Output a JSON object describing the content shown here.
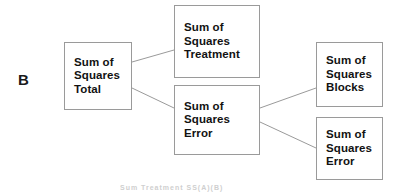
{
  "figure": {
    "panel_label": "B",
    "bottom_caption_fragment": "Sum  Treatment   SS(A)(B)",
    "line_color": "#9a9a9a",
    "box_border_color": "#9a9a9a",
    "text_color": "#121212",
    "background": "#ffffff"
  },
  "diagram_data": {
    "type": "tree-diagram",
    "title": "Sum of Squares decomposition (Panel B)",
    "nodes": [
      {
        "id": "total",
        "lines": [
          "Sum of",
          "Squares",
          "Total"
        ],
        "x": 64,
        "y": 42,
        "w": 68,
        "h": 68
      },
      {
        "id": "treatment",
        "lines": [
          "Sum of",
          "Squares",
          "Treatment"
        ],
        "x": 174,
        "y": 5,
        "w": 86,
        "h": 73
      },
      {
        "id": "error_mid",
        "lines": [
          "Sum of",
          "Squares",
          "Error"
        ],
        "x": 174,
        "y": 85,
        "w": 86,
        "h": 70
      },
      {
        "id": "blocks",
        "lines": [
          "Sum of",
          "Squares",
          "Blocks"
        ],
        "x": 316,
        "y": 42,
        "w": 67,
        "h": 65
      },
      {
        "id": "error_right",
        "lines": [
          "Sum of",
          "Squares",
          "Error"
        ],
        "x": 316,
        "y": 117,
        "w": 67,
        "h": 63
      }
    ],
    "edges": [
      {
        "from": "total",
        "to": "treatment",
        "x1": 132,
        "y1": 62,
        "x2": 174,
        "y2": 50
      },
      {
        "from": "total",
        "to": "error_mid",
        "x1": 132,
        "y1": 88,
        "x2": 174,
        "y2": 108
      },
      {
        "from": "error_mid",
        "to": "blocks",
        "x1": 260,
        "y1": 108,
        "x2": 316,
        "y2": 88
      },
      {
        "from": "error_mid",
        "to": "error_right",
        "x1": 260,
        "y1": 122,
        "x2": 316,
        "y2": 148
      }
    ]
  }
}
